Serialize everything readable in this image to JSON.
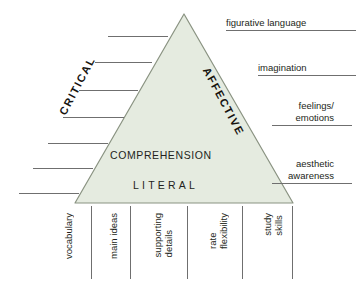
{
  "diagram": {
    "triangle": {
      "fill_color": "#e5ebe0",
      "stroke_color": "#8a9382",
      "apex": {
        "x": 184,
        "y": 14
      },
      "base_left": {
        "x": 75,
        "y": 203
      },
      "base_right": {
        "x": 293,
        "y": 203
      },
      "left_side_label": "CRITICAL",
      "right_side_label": "AFFECTIVE",
      "center_label": "COMPREHENSION",
      "base_label": "LITERAL"
    },
    "right_labels": [
      {
        "text": "figurative language",
        "underline": true
      },
      {
        "text": "imagination",
        "underline": true
      },
      {
        "text": "feelings/\nemotions",
        "underline": true
      },
      {
        "text": "aesthetic\nawareness",
        "underline": true
      }
    ],
    "bottom_labels": [
      {
        "text": "vocabulary"
      },
      {
        "text": "main ideas"
      },
      {
        "text": "supporting\ndetails"
      },
      {
        "text": "rate\nflexibility"
      },
      {
        "text": "study\nskills"
      }
    ],
    "left_rules": {
      "count": 7,
      "description": "blank horizontal rules stepping outward on the left of the triangle",
      "lines": [
        {
          "x1": 108,
          "x2": 168,
          "y": 36
        },
        {
          "x1": 95,
          "x2": 152,
          "y": 62
        },
        {
          "x1": 79,
          "x2": 138,
          "y": 90
        },
        {
          "x1": 63,
          "x2": 124,
          "y": 117
        },
        {
          "x1": 48,
          "x2": 108,
          "y": 143
        },
        {
          "x1": 33,
          "x2": 93,
          "y": 168
        },
        {
          "x1": 19,
          "x2": 79,
          "y": 193
        }
      ]
    },
    "bottom_dividers": [
      {
        "x": 91,
        "y1": 206,
        "y2": 279
      },
      {
        "x": 130,
        "y1": 206,
        "y2": 279
      },
      {
        "x": 187,
        "y1": 206,
        "y2": 279
      },
      {
        "x": 242,
        "y1": 206,
        "y2": 279
      },
      {
        "x": 292,
        "y1": 206,
        "y2": 279
      }
    ],
    "colors": {
      "rule_color": "#6f6f6f",
      "text_color": "#231f20",
      "background": "#ffffff"
    }
  }
}
